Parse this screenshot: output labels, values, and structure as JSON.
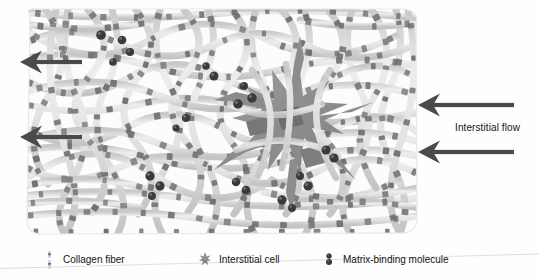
{
  "figure": {
    "type": "schematic-diagram",
    "background_color": "#fefefe"
  },
  "colors": {
    "fiber": "#d8d8d8",
    "fiber_edge": "#c2c2c2",
    "fiber_band": "#6f6f6f",
    "molecule": "#3a3a3a",
    "cell": "#8d8d8d",
    "cell_dark": "#777777",
    "arrow": "#4a4a4a",
    "text": "#141414",
    "matrix_border": "#e3e3e3"
  },
  "annotations": {
    "interstitial_flow_label": "Interstitial flow"
  },
  "arrows": [
    {
      "name": "flow-arrow-left-top",
      "x": 20,
      "y": 62,
      "length": 62,
      "direction": "left"
    },
    {
      "name": "flow-arrow-left-bottom",
      "x": 20,
      "y": 137,
      "length": 62,
      "direction": "left"
    },
    {
      "name": "flow-arrow-right-top",
      "x": 418,
      "y": 105,
      "length": 96,
      "direction": "left"
    },
    {
      "name": "flow-arrow-right-bottom",
      "x": 418,
      "y": 152,
      "length": 96,
      "direction": "left"
    }
  ],
  "legend": {
    "items": [
      {
        "icon": "collagen-fiber-icon",
        "label": "Collagen fiber",
        "x": 42,
        "y": 10
      },
      {
        "icon": "interstitial-cell-icon",
        "label": "Interstitial cell",
        "x": 198,
        "y": 10
      },
      {
        "icon": "matrix-binding-molecule-icon",
        "label": "Matrix-binding molecule",
        "x": 322,
        "y": 10
      }
    ]
  },
  "chart_data": {
    "type": "diagram",
    "title": "",
    "elements": {
      "collagen_fibers_count": 46,
      "fiber_band_count": 180,
      "matrix_binding_molecule_count": 22,
      "interstitial_cell_count": 1,
      "flow_arrow_count": 4
    },
    "matrix_bounds": {
      "x": 24,
      "y": 8,
      "width": 396,
      "height": 228
    },
    "cell_center": {
      "x": 292,
      "y": 132
    }
  }
}
